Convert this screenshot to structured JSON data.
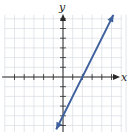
{
  "chart_data": {
    "type": "line",
    "title": "",
    "xlabel": "x",
    "ylabel": "y",
    "xlim": [
      -6,
      6
    ],
    "ylim": [
      -6,
      6
    ],
    "grid": true,
    "tick_step": 1,
    "tick_labels": false,
    "series": [
      {
        "name": "y = 2x - 4",
        "slope": 2,
        "intercept": -4,
        "x": [
          -0.7,
          5.2
        ],
        "y": [
          -5.4,
          6.4
        ],
        "color": "#3d5f9c",
        "arrows": true
      }
    ]
  }
}
